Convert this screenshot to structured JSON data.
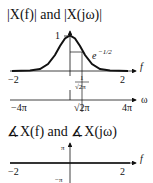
{
  "magnitude_plot": {
    "title": "|X(f)| and |X(jω)|",
    "peak_label": "1",
    "annotation": "e",
    "annotation_exp": "−1/2",
    "f_axis": {
      "label": "f",
      "ticks": [
        "−2",
        "2"
      ],
      "marker_num": "1",
      "marker_den": "√2π"
    },
    "omega_axis": {
      "label": "ω",
      "ticks": [
        "−4π",
        "√2π",
        "4π"
      ]
    }
  },
  "phase_plot": {
    "title": "∡X(f) and ∡X(jω)",
    "y_ticks": [
      "π",
      "−π"
    ],
    "f_axis": {
      "label": "f",
      "ticks": [
        "−2",
        "2"
      ]
    }
  }
}
